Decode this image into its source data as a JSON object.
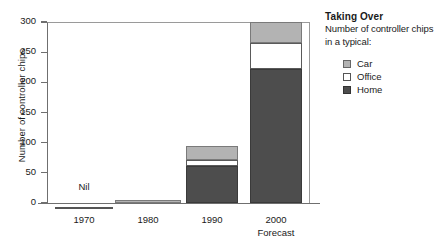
{
  "chart_data": {
    "type": "bar",
    "title": "Taking Over",
    "subtitle_line1": "Number of controller chips",
    "subtitle_line2": "in a typical:",
    "xlabel": "",
    "ylabel": "Number of controller chips",
    "categories": [
      "1970",
      "1980",
      "1990",
      "2000"
    ],
    "category_notes": [
      "Nil",
      "",
      "",
      "Forecast"
    ],
    "ylim": [
      0,
      300
    ],
    "yticks": [
      0,
      50,
      100,
      150,
      200,
      250,
      300
    ],
    "grid": false,
    "stacked": true,
    "legend_position": "right",
    "series": [
      {
        "name": "Home",
        "color": "#4d4d4d",
        "values": [
          0,
          0,
          62,
          222
        ]
      },
      {
        "name": "Office",
        "color": "#ffffff",
        "values": [
          0,
          0,
          9,
          43
        ]
      },
      {
        "name": "Car",
        "color": "#b3b3b3",
        "values": [
          0,
          5,
          24,
          35
        ]
      }
    ],
    "totals": [
      0,
      5,
      95,
      300
    ]
  },
  "axis": {
    "ytick_labels": [
      "0",
      "50",
      "100",
      "150",
      "200",
      "250",
      "300"
    ]
  },
  "legend": {
    "title": "Taking Over",
    "line1": "Number of controller chips",
    "line2": "in a typical:",
    "items": [
      {
        "label": "Car",
        "swatch": "car"
      },
      {
        "label": "Office",
        "swatch": "office"
      },
      {
        "label": "Home",
        "swatch": "home"
      }
    ]
  }
}
